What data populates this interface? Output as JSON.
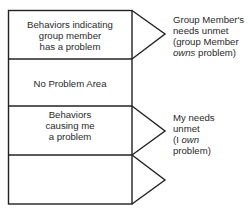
{
  "diagram": {
    "rows": [
      {
        "id": "group-member-problem",
        "lines": [
          "Behaviors indicating",
          "group member",
          "has a problem"
        ],
        "has_arrow": true
      },
      {
        "id": "no-problem-area",
        "lines": [
          "No Problem Area"
        ],
        "has_arrow": false
      },
      {
        "id": "causing-me-problem",
        "lines": [
          "Behaviors",
          "causing me",
          "a problem"
        ],
        "has_arrow": true
      },
      {
        "id": "empty-bottom",
        "lines": [],
        "has_arrow": true
      }
    ],
    "annotations": [
      {
        "row": "group-member-problem",
        "line1": "Group Member's",
        "line2": "needs unmet",
        "line3": "(group Member",
        "line4_italic": "owns",
        "line4_rest": " problem)"
      },
      {
        "row": "causing-me-problem",
        "line1": "My needs",
        "line2": "unmet",
        "line3_pre": "(I ",
        "line3_italic": "own",
        "line4": "problem)"
      }
    ]
  }
}
